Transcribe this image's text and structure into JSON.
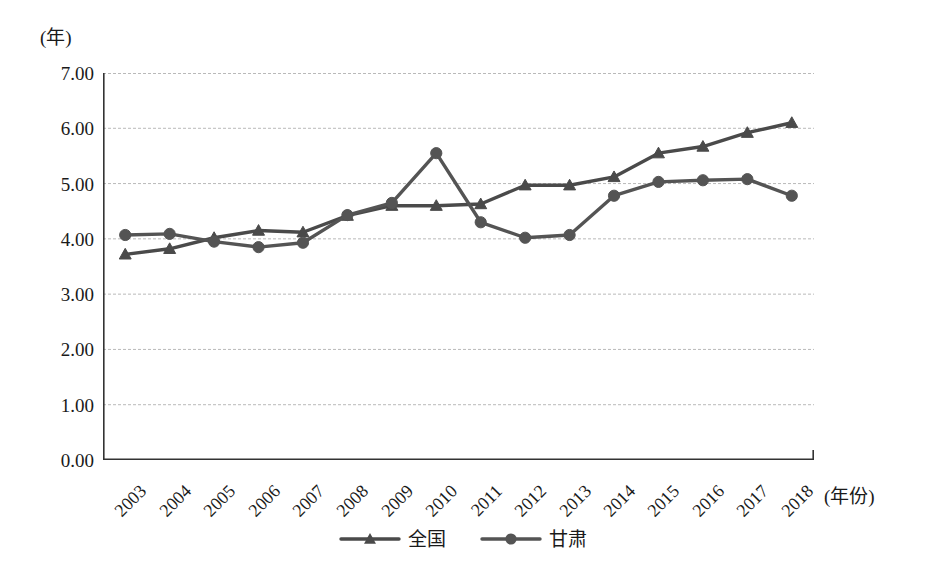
{
  "chart_data": {
    "type": "line",
    "title": "",
    "subtitle": "",
    "xlabel": "(年份)",
    "ylabel": "(年)",
    "x": [
      "2003",
      "2004",
      "2005",
      "2006",
      "2007",
      "2008",
      "2009",
      "2010",
      "2011",
      "2012",
      "2013",
      "2014",
      "2015",
      "2016",
      "2017",
      "2018"
    ],
    "categories": [
      "2003",
      "2004",
      "2005",
      "2006",
      "2007",
      "2008",
      "2009",
      "2010",
      "2011",
      "2012",
      "2013",
      "2014",
      "2015",
      "2016",
      "2017",
      "2018"
    ],
    "series": [
      {
        "name": "全国",
        "marker": "triangle",
        "color": "#4a4a4a",
        "values": [
          3.72,
          3.82,
          4.02,
          4.15,
          4.12,
          4.42,
          4.6,
          4.6,
          4.63,
          4.97,
          4.97,
          5.12,
          5.55,
          5.67,
          5.92,
          6.1
        ]
      },
      {
        "name": "甘肃",
        "marker": "circle",
        "color": "#545454",
        "values": [
          4.07,
          4.09,
          3.95,
          3.85,
          3.93,
          4.43,
          4.65,
          5.55,
          4.3,
          4.02,
          4.07,
          4.78,
          5.03,
          5.06,
          5.08,
          4.78
        ]
      }
    ],
    "ylim": [
      0.0,
      7.0
    ],
    "ytick_labels": [
      "7.00",
      "6.00",
      "5.00",
      "4.00",
      "3.00",
      "2.00",
      "1.00",
      "0.00"
    ],
    "ytick_values": [
      7.0,
      6.0,
      5.0,
      4.0,
      3.0,
      2.0,
      1.0,
      0.0
    ],
    "grid": true,
    "grid_axis": "y",
    "grid_color": "#b9b9b9",
    "axis_color": "#333333",
    "legend_position": "bottom",
    "legend_entries": [
      "全国",
      "甘肃"
    ]
  }
}
